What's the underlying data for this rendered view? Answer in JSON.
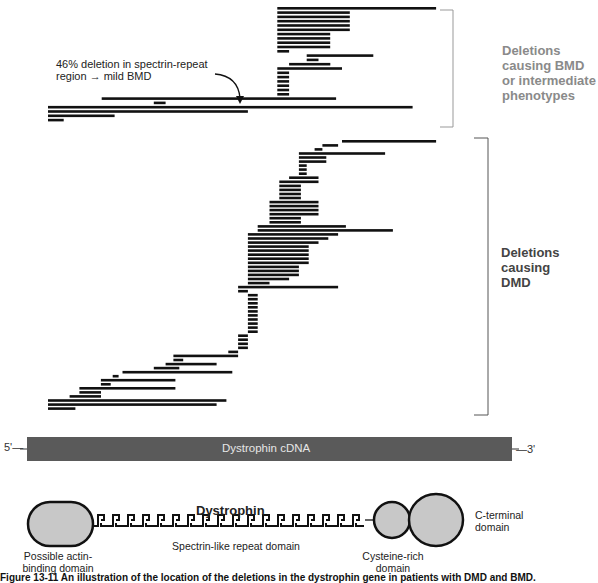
{
  "annotation": {
    "line1": "46% deletion in spectrin-repeat",
    "line2": "region → mild BMD"
  },
  "groups": {
    "bmd": {
      "line1": "Deletions",
      "line2": "causing BMD",
      "line3": "or intermediate",
      "line4": "phenotypes"
    },
    "dmd": {
      "line1": "Deletions",
      "line2": "causing",
      "line3": "DMD"
    }
  },
  "cdna": {
    "label": "Dystrophin cDNA",
    "five_prime": "5'—",
    "three_prime": "—3'",
    "color": "#5a5a5a"
  },
  "protein": {
    "title": "Dystrophin",
    "actin_label_1": "Possible actin-",
    "actin_label_2": "binding domain",
    "spectrin_label": "Spectrin-like repeat domain",
    "cysteine_label_1": "Cysteine-rich",
    "cysteine_label_2": "domain",
    "cterm_label_1": "C-terminal",
    "cterm_label_2": "domain",
    "domain_fill": "#c8c8c8"
  },
  "caption": "Figure 13-11  An illustration of the location of the deletions in the dystrophin gene in patients with DMD and BMD.",
  "deletions_note": "Each bar = one patient deletion, spanning a fraction (0–1) of the dystrophin cDNA from 5' to 3'",
  "bmd_deletions": [
    [
      0.585,
      0.99
    ],
    [
      0.585,
      0.77
    ],
    [
      0.585,
      0.77
    ],
    [
      0.585,
      0.77
    ],
    [
      0.585,
      0.77
    ],
    [
      0.585,
      0.77
    ],
    [
      0.585,
      0.72
    ],
    [
      0.585,
      0.72
    ],
    [
      0.585,
      0.72
    ],
    [
      0.585,
      0.72
    ],
    [
      0.585,
      0.615
    ],
    [
      0.66,
      0.83
    ],
    [
      0.66,
      0.69
    ],
    [
      0.615,
      0.72
    ],
    [
      0.585,
      0.75
    ],
    [
      0.585,
      0.615
    ],
    [
      0.585,
      0.615
    ],
    [
      0.585,
      0.615
    ],
    [
      0.585,
      0.615
    ],
    [
      0.585,
      0.615
    ],
    [
      0.585,
      0.615
    ],
    [
      0.137,
      0.735
    ],
    [
      0.27,
      0.3
    ],
    [
      0.0,
      0.93
    ],
    [
      0.0,
      0.51
    ],
    [
      0.0,
      0.17
    ],
    [
      0.0,
      0.04
    ]
  ],
  "dmd_deletions": [
    [
      0.75,
      0.99
    ],
    [
      0.7,
      0.74
    ],
    [
      0.68,
      0.7
    ],
    [
      0.64,
      0.86
    ],
    [
      0.64,
      0.71
    ],
    [
      0.64,
      0.71
    ],
    [
      0.64,
      0.66
    ],
    [
      0.64,
      0.66
    ],
    [
      0.64,
      0.66
    ],
    [
      0.615,
      0.69
    ],
    [
      0.59,
      0.69
    ],
    [
      0.59,
      0.645
    ],
    [
      0.59,
      0.645
    ],
    [
      0.59,
      0.645
    ],
    [
      0.59,
      0.645
    ],
    [
      0.565,
      0.69
    ],
    [
      0.565,
      0.69
    ],
    [
      0.565,
      0.69
    ],
    [
      0.565,
      0.69
    ],
    [
      0.565,
      0.645
    ],
    [
      0.565,
      0.645
    ],
    [
      0.535,
      0.76
    ],
    [
      0.535,
      0.88
    ],
    [
      0.51,
      0.74
    ],
    [
      0.51,
      0.715
    ],
    [
      0.51,
      0.69
    ],
    [
      0.51,
      0.665
    ],
    [
      0.51,
      0.665
    ],
    [
      0.51,
      0.665
    ],
    [
      0.51,
      0.665
    ],
    [
      0.51,
      0.665
    ],
    [
      0.51,
      0.64
    ],
    [
      0.51,
      0.64
    ],
    [
      0.51,
      0.64
    ],
    [
      0.51,
      0.615
    ],
    [
      0.51,
      0.565
    ],
    [
      0.485,
      0.74
    ],
    [
      0.485,
      0.51
    ],
    [
      0.51,
      0.535
    ],
    [
      0.51,
      0.535
    ],
    [
      0.51,
      0.535
    ],
    [
      0.51,
      0.535
    ],
    [
      0.51,
      0.535
    ],
    [
      0.51,
      0.535
    ],
    [
      0.51,
      0.535
    ],
    [
      0.51,
      0.535
    ],
    [
      0.51,
      0.535
    ],
    [
      0.51,
      0.535
    ],
    [
      0.485,
      0.51
    ],
    [
      0.485,
      0.51
    ],
    [
      0.485,
      0.51
    ],
    [
      0.485,
      0.51
    ],
    [
      0.46,
      0.485
    ],
    [
      0.32,
      0.485
    ],
    [
      0.32,
      0.345
    ],
    [
      0.3,
      0.43
    ],
    [
      0.27,
      0.335
    ],
    [
      0.19,
      0.47
    ],
    [
      0.165,
      0.18
    ],
    [
      0.135,
      0.325
    ],
    [
      0.135,
      0.16
    ],
    [
      0.08,
      0.325
    ],
    [
      0.08,
      0.135
    ],
    [
      0.055,
      0.135
    ],
    [
      0.0,
      0.455
    ],
    [
      0.0,
      0.43
    ],
    [
      0.0,
      0.07
    ]
  ]
}
